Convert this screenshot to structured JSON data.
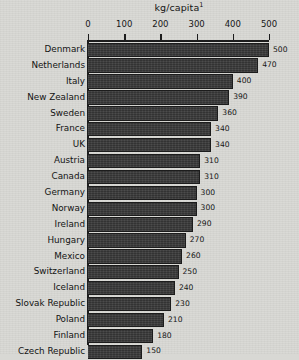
{
  "chart_data": {
    "type": "bar",
    "orientation": "horizontal",
    "title": "kg/capita",
    "title_superscript": "1",
    "xlabel": "",
    "ylabel": "",
    "xlim": [
      0,
      500
    ],
    "grid": false,
    "legend": null,
    "axis_ticks": [
      {
        "value": 0,
        "label": "0"
      },
      {
        "value": 100,
        "label": "100"
      },
      {
        "value": 200,
        "label": "200"
      },
      {
        "value": 300,
        "label": "300"
      },
      {
        "value": 400,
        "label": "400"
      },
      {
        "value": 500,
        "label": "500"
      }
    ],
    "categories": [
      "Denmark",
      "Netherlands",
      "Italy",
      "New Zealand",
      "Sweden",
      "France",
      "UK",
      "Austria",
      "Canada",
      "Germany",
      "Norway",
      "Ireland",
      "Hungary",
      "Mexico",
      "Switzerland",
      "Iceland",
      "Slovak Republic",
      "Poland",
      "Finland",
      "Czech Republic"
    ],
    "values": [
      500,
      470,
      400,
      390,
      360,
      340,
      340,
      310,
      310,
      300,
      300,
      290,
      270,
      260,
      250,
      240,
      230,
      210,
      180,
      150
    ],
    "value_labels": [
      "500",
      "470",
      "400",
      "390",
      "360",
      "340",
      "340",
      "310",
      "310",
      "300",
      "300",
      "290",
      "270",
      "260",
      "250",
      "240",
      "230",
      "210",
      "180",
      "150"
    ],
    "colors": {
      "bar_fill": "#3a3a3a",
      "bar_edge": "#1c1c1c",
      "background": "#d8d8d4",
      "text": "#141414",
      "axis": "#1d1d1d"
    }
  }
}
